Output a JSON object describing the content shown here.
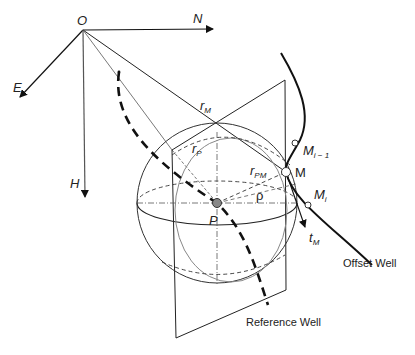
{
  "diagram": {
    "colors": {
      "stroke": "#111111",
      "thin": "#555555",
      "point_fill": "#888888",
      "background": "#ffffff"
    },
    "axes": {
      "origin": "O",
      "north": "N",
      "east": "E",
      "down": "H"
    },
    "vectors": {
      "r_M": {
        "base": "r",
        "sub": "M"
      },
      "r_P": {
        "base": "r",
        "sub": "P"
      },
      "r_PM": {
        "base": "r",
        "sub": "PM"
      },
      "rho": "ρ",
      "t_M": {
        "base": "t",
        "sub": "M"
      }
    },
    "points": {
      "P": "P",
      "M": "M",
      "M_prev": {
        "base": "M",
        "sub": "i − 1"
      },
      "M_i": {
        "base": "M",
        "sub": "i"
      }
    },
    "curves": {
      "offset_well": "Offset Well",
      "reference_well": "Reference Well"
    }
  }
}
